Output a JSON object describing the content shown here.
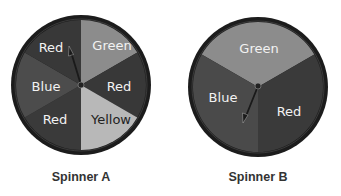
{
  "spinners": [
    {
      "label": "Spinner A",
      "sectors": [
        {
          "label": "Green",
          "start_deg": 0,
          "end_deg": 60,
          "shade": "#8c8c8c",
          "text_shade": "#f2f2f2"
        },
        {
          "label": "Red",
          "start_deg": 60,
          "end_deg": 120,
          "shade": "#383838",
          "text_shade": "#f2f2f2"
        },
        {
          "label": "Yellow",
          "start_deg": 120,
          "end_deg": 180,
          "shade": "#b8b8b8",
          "text_shade": "#222222"
        },
        {
          "label": "Red",
          "start_deg": 180,
          "end_deg": 240,
          "shade": "#3a3a3a",
          "text_shade": "#f2f2f2"
        },
        {
          "label": "Blue",
          "start_deg": 240,
          "end_deg": 300,
          "shade": "#4c4c4c",
          "text_shade": "#f2f2f2"
        },
        {
          "label": "Red",
          "start_deg": 300,
          "end_deg": 360,
          "shade": "#383838",
          "text_shade": "#f2f2f2"
        }
      ],
      "needle_direction": "up-left, pointing into top-left Red sector near the boundary"
    },
    {
      "label": "Spinner B",
      "sectors": [
        {
          "label": "Green",
          "start_deg": 300,
          "end_deg": 60,
          "shade": "#8c8c8c",
          "text_shade": "#f2f2f2"
        },
        {
          "label": "Red",
          "start_deg": 60,
          "end_deg": 180,
          "shade": "#3a3a3a",
          "text_shade": "#f2f2f2"
        },
        {
          "label": "Blue",
          "start_deg": 180,
          "end_deg": 300,
          "shade": "#4a4a4a",
          "text_shade": "#f2f2f2"
        }
      ],
      "needle_direction": "down-left, pointing into Blue sector"
    }
  ],
  "colors": {
    "background": "#ffffff",
    "rim": "#1c1c1c",
    "caption": "#333333"
  }
}
